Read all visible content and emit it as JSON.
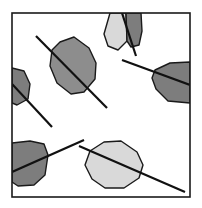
{
  "figure": {
    "type": "diagram",
    "canvas": {
      "width": 202,
      "height": 208,
      "background": "#ffffff"
    },
    "frame": {
      "name": "plot-frame",
      "x": 12,
      "y": 13,
      "width": 178,
      "height": 184,
      "stroke": "#1a1a1a",
      "stroke_width": 1.6,
      "fill": "none"
    },
    "palette": {
      "outline": "#1a1a1a",
      "axis": "#111111",
      "fill_dark": "#7d7d7d",
      "fill_medium": "#8d8d8d",
      "fill_light": "#d9d9d9",
      "background": "#ffffff"
    },
    "grain_outline_width": 1.4,
    "axis_stroke_width": 2.2,
    "grains": [
      {
        "id": "grain-top-light",
        "label": "top light polygon",
        "shade": "light",
        "fill": "#d9d9d9",
        "clipped_edge": "top",
        "points": "110,13 104,34 108,46 118,50 127,41 126,13"
      },
      {
        "id": "grain-top-dark",
        "label": "top dark polygon",
        "shade": "dark",
        "fill": "#7d7d7d",
        "clipped_edge": "top",
        "points": "126,13 127,41 131,47 139,45 142,31 141,13"
      },
      {
        "id": "grain-left-upper-dark",
        "label": "left upper dark polygon",
        "shade": "dark",
        "fill": "#7d7d7d",
        "clipped_edge": "left",
        "points": "12,68 24,71 30,84 28,99 17,105 12,103"
      },
      {
        "id": "grain-center-medium",
        "label": "center medium polygon",
        "shade": "medium",
        "fill": "#8d8d8d",
        "clipped_edge": "none",
        "points": "60,42 74,37 89,48 96,63 95,79 84,92 71,94 57,83 50,66 52,50"
      },
      {
        "id": "grain-right-dark",
        "label": "right dark polygon",
        "shade": "dark",
        "fill": "#7d7d7d",
        "clipped_edge": "right",
        "points": "155,70 170,63 190,62 190,103 168,101 156,89 152,78"
      },
      {
        "id": "grain-bottom-left-dark",
        "label": "bottom left dark polygon",
        "shade": "dark",
        "fill": "#7d7d7d",
        "clipped_edge": "left",
        "points": "12,143 30,141 44,144 48,155 45,175 34,185 18,186 12,182"
      },
      {
        "id": "grain-bottom-light",
        "label": "bottom light polygon",
        "shade": "light",
        "fill": "#d9d9d9",
        "clipped_edge": "none",
        "points": "90,151 104,142 121,141 137,152 143,165 139,178 124,188 105,188 92,179 85,165"
      }
    ],
    "axes": [
      {
        "id": "axis-center",
        "label": "center grain orientation axis",
        "x1": 36,
        "y1": 36,
        "x2": 107,
        "y2": 108
      },
      {
        "id": "axis-top",
        "label": "top grain orientation axis",
        "x1": 122,
        "y1": 13,
        "x2": 136,
        "y2": 56
      },
      {
        "id": "axis-left-upper",
        "label": "left upper grain orientation axis",
        "x1": 12,
        "y1": 84,
        "x2": 52,
        "y2": 127
      },
      {
        "id": "axis-right",
        "label": "right grain orientation axis",
        "x1": 122,
        "y1": 60,
        "x2": 190,
        "y2": 85
      },
      {
        "id": "axis-bottom-left",
        "label": "bottom left grain orientation axis",
        "x1": 12,
        "y1": 172,
        "x2": 84,
        "y2": 140
      },
      {
        "id": "axis-bottom-right",
        "label": "bottom right grain orientation axis",
        "x1": 79,
        "y1": 146,
        "x2": 185,
        "y2": 192
      }
    ]
  }
}
